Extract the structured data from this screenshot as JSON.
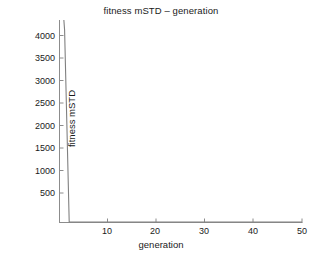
{
  "chart_data": {
    "type": "line",
    "title": "fitness mSTD – generation",
    "xlabel": "generation",
    "ylabel": "fitness mSTD",
    "xlim": [
      0,
      50
    ],
    "ylim": [
      0,
      4500
    ],
    "xticks": [
      10,
      20,
      30,
      40,
      50
    ],
    "yticks": [
      500,
      1000,
      1500,
      2000,
      2500,
      3000,
      3500,
      4000
    ],
    "xtick_labels": [
      "10",
      "20",
      "30",
      "40",
      "50"
    ],
    "ytick_labels": [
      "500",
      "1000",
      "1500",
      "2000",
      "2500",
      "3000",
      "3500",
      "4000"
    ],
    "grid": false,
    "legend": null,
    "line_color": "#808080",
    "axis_color": "#808080",
    "spines": [
      "left",
      "bottom"
    ],
    "series": [
      {
        "name": "fitness mSTD",
        "x": [
          1,
          1.15,
          2.1,
          3,
          4,
          5,
          6,
          7,
          8,
          9,
          10,
          12,
          14,
          16,
          18,
          20,
          22,
          24,
          26,
          28,
          30,
          32,
          34,
          36,
          38,
          40,
          42,
          44,
          46,
          48,
          50
        ],
        "y": [
          4500,
          4280,
          0,
          0,
          0,
          0,
          0,
          0,
          0,
          0,
          0,
          0,
          0,
          0,
          0,
          0,
          0,
          0,
          0,
          0,
          0,
          0,
          0,
          0,
          0,
          0,
          0,
          0,
          0,
          0,
          0
        ]
      }
    ],
    "annotations": []
  },
  "axes": {
    "title": "fitness mSTD – generation",
    "xlabel": "generation",
    "ylabel": "fitness mSTD"
  }
}
